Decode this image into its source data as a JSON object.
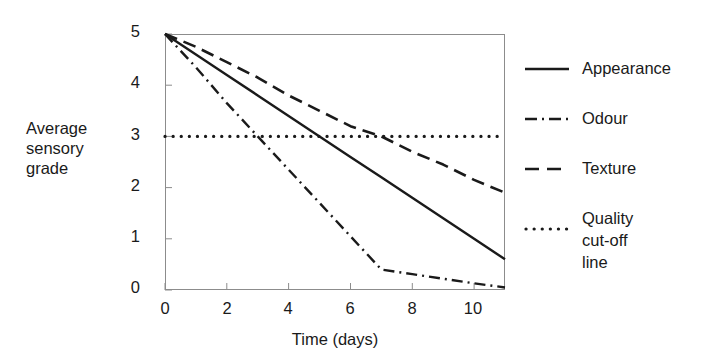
{
  "chart_data": {
    "type": "line",
    "title": "",
    "xlabel": "Time (days)",
    "ylabel": "Average\nsensory\ngrade",
    "xlim": [
      0,
      11
    ],
    "ylim": [
      0,
      5
    ],
    "xticks": [
      0,
      2,
      4,
      6,
      8,
      10
    ],
    "yticks": [
      0,
      1,
      2,
      3,
      4,
      5
    ],
    "xtick_labels": [
      "0",
      "2",
      "4",
      "6",
      "8",
      "10"
    ],
    "ytick_labels": [
      "0",
      "1",
      "2",
      "3",
      "4",
      "5"
    ],
    "grid": false,
    "legend_position": "right",
    "line_color": "#1a1a1a",
    "axis_color": "#8c8c8c",
    "series": [
      {
        "name": "Appearance",
        "style": "solid",
        "x": [
          0,
          1,
          2,
          3,
          4,
          5,
          6,
          7,
          8,
          9,
          10,
          11
        ],
        "values": [
          5.0,
          4.6,
          4.2,
          3.8,
          3.4,
          3.0,
          2.6,
          2.2,
          1.8,
          1.4,
          1.0,
          0.6
        ]
      },
      {
        "name": "Odour",
        "style": "dash-dot",
        "x": [
          0,
          1,
          2,
          3,
          4,
          5,
          6,
          7,
          8,
          9,
          10,
          11
        ],
        "values": [
          5.0,
          4.35,
          3.65,
          3.0,
          2.35,
          1.7,
          1.05,
          0.4,
          0.31,
          0.22,
          0.13,
          0.05
        ]
      },
      {
        "name": "Texture",
        "style": "dashed",
        "x": [
          0,
          1,
          2,
          3,
          4,
          5,
          6,
          7,
          8,
          9,
          10,
          11
        ],
        "values": [
          5.0,
          4.75,
          4.45,
          4.15,
          3.8,
          3.5,
          3.2,
          3.0,
          2.7,
          2.45,
          2.15,
          1.9
        ]
      },
      {
        "name": "Quality cut-off line",
        "style": "dotted",
        "x": [
          0,
          11
        ],
        "values": [
          3.0,
          3.0
        ]
      }
    ],
    "annotations": {
      "cutoff_value": 3,
      "appearance_crosses_cutoff_day": 5,
      "odour_crosses_cutoff_day": 3,
      "texture_crosses_cutoff_day": 7.2
    }
  },
  "legend": {
    "entries": [
      {
        "label": "Appearance",
        "swatch": "solid-line-icon"
      },
      {
        "label": "Odour",
        "swatch": "dash-dot-line-icon"
      },
      {
        "label": "Texture",
        "swatch": "dashed-line-icon"
      },
      {
        "label": "Quality\ncut-off line",
        "swatch": "dotted-line-icon"
      }
    ]
  }
}
